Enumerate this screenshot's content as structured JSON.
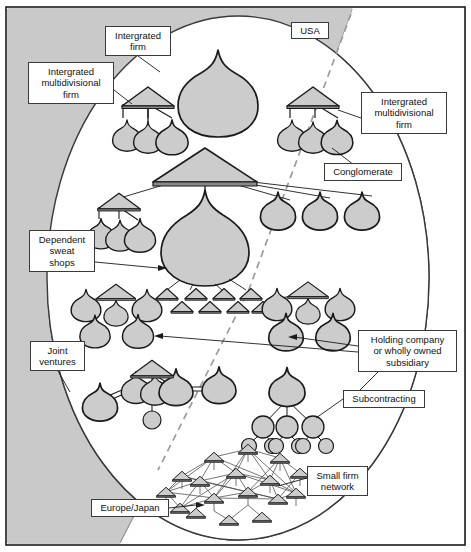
{
  "figure": {
    "background_color": "#ffffff",
    "region_fill": "#c9c9c9",
    "node_fill": "#cccccc",
    "stroke": "#1a1a1a",
    "width": 471,
    "height": 552
  },
  "regions": [
    {
      "name": "usa-region",
      "label": "USA"
    },
    {
      "name": "europe-japan-region",
      "label": "Europe/Japan"
    }
  ],
  "labels": [
    {
      "id": "integrated-firm",
      "text": "Intergrated\nfirm",
      "x": 105,
      "y": 26,
      "w": 66,
      "h": 30
    },
    {
      "id": "usa",
      "text": "USA",
      "x": 291,
      "y": 22,
      "w": 38,
      "h": 17
    },
    {
      "id": "integrated-multi-left",
      "text": "Intergrated\nmultidivisional\nfirm",
      "x": 28,
      "y": 62,
      "w": 86,
      "h": 42
    },
    {
      "id": "integrated-multi-right",
      "text": "Intergrated\nmultidivisional\nfirm",
      "x": 361,
      "y": 92,
      "w": 86,
      "h": 42
    },
    {
      "id": "conglomerate",
      "text": "Conglomerate",
      "x": 324,
      "y": 163,
      "w": 78,
      "h": 18
    },
    {
      "id": "dependent-sweat-shops",
      "text": "Dependent\nsweat\nshops",
      "x": 29,
      "y": 230,
      "w": 66,
      "h": 42
    },
    {
      "id": "joint-ventures",
      "text": "Joint\nventures",
      "x": 30,
      "y": 341,
      "w": 55,
      "h": 30
    },
    {
      "id": "holding-company",
      "text": "Holding company\nor wholly owned\nsubsidiary",
      "x": 358,
      "y": 330,
      "w": 99,
      "h": 42
    },
    {
      "id": "subcontracting",
      "text": "Subcontracting",
      "x": 343,
      "y": 390,
      "w": 82,
      "h": 18
    },
    {
      "id": "small-firm-network",
      "text": "Small firm\nnetwork",
      "x": 307,
      "y": 466,
      "w": 61,
      "h": 30
    },
    {
      "id": "europe-japan",
      "text": "Europe/Japan",
      "x": 91,
      "y": 499,
      "w": 78,
      "h": 18
    }
  ],
  "structures": [
    {
      "id": "integrated-firm-node",
      "type": "single-onion",
      "count": 1
    },
    {
      "id": "integrated-multidivisional-left",
      "type": "roof-with-onions",
      "count": 3
    },
    {
      "id": "integrated-multidivisional-right",
      "type": "roof-with-onions",
      "count": 3
    },
    {
      "id": "conglomerate-group",
      "type": "big-roof-hub",
      "count": 4,
      "sweat_shops": 8
    },
    {
      "id": "joint-venture-cluster-left",
      "type": "roof-with-onions",
      "count": 5
    },
    {
      "id": "holding-company-cluster-right",
      "type": "roof-with-onions",
      "count": 5
    },
    {
      "id": "joint-venture-chain",
      "type": "linked-onions",
      "count": 6
    },
    {
      "id": "subcontracting-tree",
      "type": "tree",
      "levels": 3,
      "count": 10
    },
    {
      "id": "small-firm-network-mesh",
      "type": "mesh",
      "count": 17
    }
  ]
}
